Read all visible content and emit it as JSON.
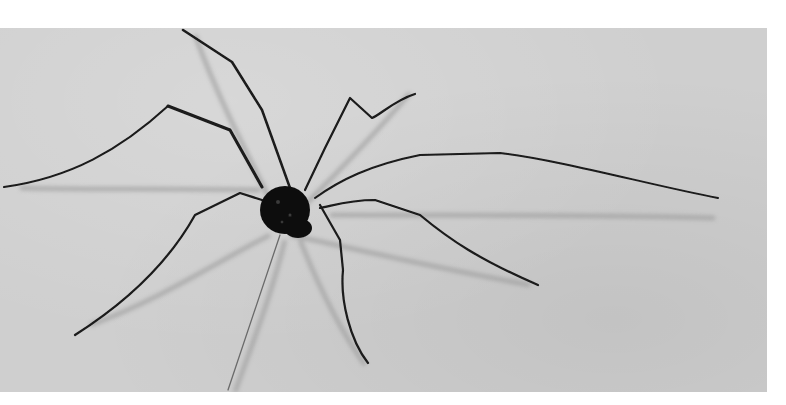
{
  "image": {
    "subject": "harvestman (daddy long-legs) on a light fabric surface",
    "style": "black-and-white photograph",
    "colors": {
      "background": "#ffffff",
      "surface": "#cfcfcf",
      "body": "#111111",
      "legs": "#1a1a1a",
      "shadow": "#9a9a9a"
    }
  }
}
